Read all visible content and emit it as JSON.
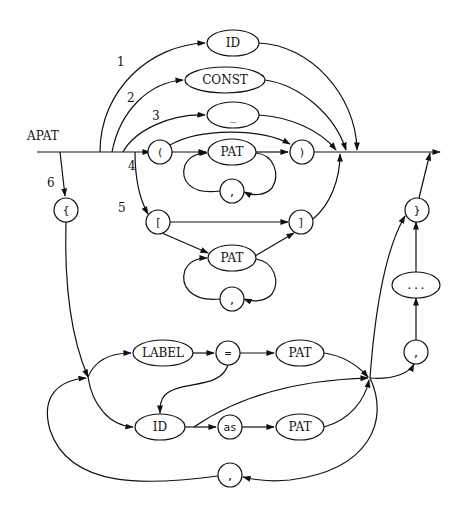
{
  "title": "APAT",
  "nodes": {
    "id_top": "ID",
    "const": "CONST",
    "wildcard": "_",
    "lparen": "(",
    "pat_paren": "PAT",
    "rparen": ")",
    "comma_paren": ",",
    "lbracket": "[",
    "rbracket": "]",
    "pat_bracket": "PAT",
    "comma_bracket": ",",
    "lbrace": "{",
    "rbrace": "}",
    "ellipsis": "...",
    "comma_record_end": ",",
    "label": "LABEL",
    "equals": "=",
    "pat_label": "PAT",
    "id_record": "ID",
    "as": "as",
    "pat_as": "PAT",
    "comma_record": ","
  },
  "branch_numbers": [
    "1",
    "2",
    "3",
    "4",
    "5",
    "6"
  ]
}
